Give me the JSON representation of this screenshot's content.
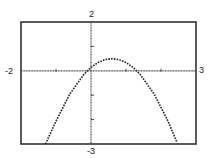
{
  "chart_data": {
    "type": "line",
    "title": "",
    "xlabel": "",
    "ylabel": "",
    "xlim": [
      -2,
      3
    ],
    "ylim": [
      -3,
      2
    ],
    "grid": false,
    "legend": null,
    "window_labels": {
      "xmin": "-2",
      "xmax": "3",
      "ymin": "-3",
      "ymax": "2"
    },
    "x_ticks": [
      -1,
      0,
      1,
      2
    ],
    "y_ticks": [
      -2,
      -1,
      0,
      1
    ],
    "series": [
      {
        "name": "parabola",
        "style": "dotted",
        "equation_estimate": "y = -(x - 0.6)^2 + 0.5",
        "x": [
          -1.3,
          -1.0,
          -0.6,
          -0.2,
          0.0,
          0.2,
          0.4,
          0.6,
          0.8,
          1.0,
          1.2,
          1.4,
          1.8,
          2.2,
          2.45
        ],
        "y": [
          -3.11,
          -2.06,
          -0.94,
          -0.14,
          0.14,
          0.34,
          0.46,
          0.5,
          0.46,
          0.34,
          0.14,
          -0.14,
          -0.94,
          -2.06,
          -2.92
        ]
      }
    ]
  },
  "colors": {
    "frame": "#333333",
    "axes": "#444444",
    "curve": "#222222",
    "background": "#ffffff"
  }
}
